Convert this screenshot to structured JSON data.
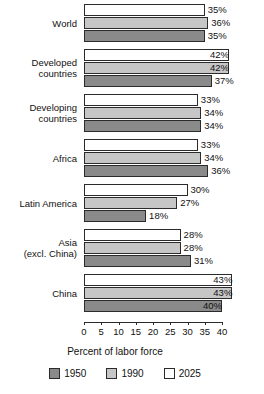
{
  "chart_data": {
    "type": "bar",
    "orientation": "horizontal",
    "title": "",
    "xlabel": "Percent of labor force",
    "ylabel": "",
    "xlim": [
      0,
      40
    ],
    "xticks": [
      0,
      5,
      10,
      15,
      20,
      25,
      30,
      35,
      40
    ],
    "xtick_labels": [
      "0",
      "5",
      "10",
      "15",
      "20",
      "25",
      "30",
      "35",
      "40"
    ],
    "grid": false,
    "legend_position": "bottom",
    "value_suffix": "%",
    "categories": [
      "World",
      "Developed\ncountries",
      "Developing\ncountries",
      "Africa",
      "Latin America",
      "Asia\n(excl. China)",
      "China"
    ],
    "series": [
      {
        "name": "2025",
        "color": "#ffffff",
        "values": [
          35,
          42,
          33,
          33,
          30,
          28,
          43
        ]
      },
      {
        "name": "1990",
        "color": "#c6c6c6",
        "values": [
          36,
          42,
          34,
          34,
          27,
          28,
          43
        ]
      },
      {
        "name": "1950",
        "color": "#8a8a8a",
        "values": [
          35,
          37,
          34,
          36,
          18,
          31,
          40
        ]
      }
    ],
    "groups": [
      {
        "label": "World",
        "rows": [
          {
            "year": "2025",
            "value": 35,
            "label": "35%",
            "label_inside": false
          },
          {
            "year": "1990",
            "value": 36,
            "label": "36%",
            "label_inside": false
          },
          {
            "year": "1950",
            "value": 35,
            "label": "35%",
            "label_inside": false
          }
        ]
      },
      {
        "label": "Developed\ncountries",
        "rows": [
          {
            "year": "2025",
            "value": 42,
            "label": "42%",
            "label_inside": true
          },
          {
            "year": "1990",
            "value": 42,
            "label": "42%",
            "label_inside": true
          },
          {
            "year": "1950",
            "value": 37,
            "label": "37%",
            "label_inside": false
          }
        ]
      },
      {
        "label": "Developing\ncountries",
        "rows": [
          {
            "year": "2025",
            "value": 33,
            "label": "33%",
            "label_inside": false
          },
          {
            "year": "1990",
            "value": 34,
            "label": "34%",
            "label_inside": false
          },
          {
            "year": "1950",
            "value": 34,
            "label": "34%",
            "label_inside": false
          }
        ]
      },
      {
        "label": "Africa",
        "rows": [
          {
            "year": "2025",
            "value": 33,
            "label": "33%",
            "label_inside": false
          },
          {
            "year": "1990",
            "value": 34,
            "label": "34%",
            "label_inside": false
          },
          {
            "year": "1950",
            "value": 36,
            "label": "36%",
            "label_inside": false
          }
        ]
      },
      {
        "label": "Latin America",
        "rows": [
          {
            "year": "2025",
            "value": 30,
            "label": "30%",
            "label_inside": false
          },
          {
            "year": "1990",
            "value": 27,
            "label": "27%",
            "label_inside": false
          },
          {
            "year": "1950",
            "value": 18,
            "label": "18%",
            "label_inside": false
          }
        ]
      },
      {
        "label": "Asia\n(excl. China)",
        "rows": [
          {
            "year": "2025",
            "value": 28,
            "label": "28%",
            "label_inside": false
          },
          {
            "year": "1990",
            "value": 28,
            "label": "28%",
            "label_inside": false
          },
          {
            "year": "1950",
            "value": 31,
            "label": "31%",
            "label_inside": false
          }
        ]
      },
      {
        "label": "China",
        "rows": [
          {
            "year": "2025",
            "value": 43,
            "label": "43%",
            "label_inside": true
          },
          {
            "year": "1990",
            "value": 43,
            "label": "43%",
            "label_inside": true
          },
          {
            "year": "1950",
            "value": 40,
            "label": "40%",
            "label_inside": true
          }
        ]
      }
    ],
    "legend": [
      {
        "name": "1950",
        "color": "#8a8a8a"
      },
      {
        "name": "1990",
        "color": "#c6c6c6"
      },
      {
        "name": "2025",
        "color": "#ffffff"
      }
    ]
  }
}
